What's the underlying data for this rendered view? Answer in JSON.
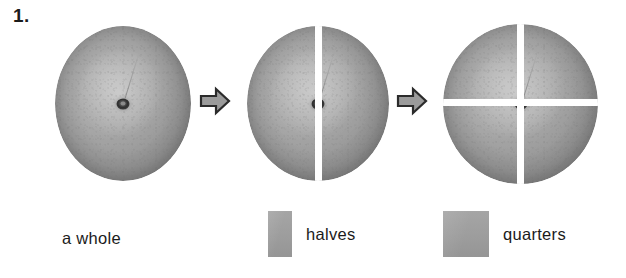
{
  "worksheet": {
    "question_number": "1.",
    "background_color": "#ffffff",
    "text_color": "#1b1b1b"
  },
  "diagram": {
    "type": "fraction-partition-sequence",
    "stages": [
      {
        "name": "whole",
        "label": "a whole",
        "pieces": 1,
        "cuts": [],
        "fruit_color": "#a9a9a9"
      },
      {
        "name": "halves",
        "label": "halves",
        "pieces": 2,
        "cuts": [
          "vertical"
        ],
        "fruit_color": "#a9a9a9"
      },
      {
        "name": "quarters",
        "label": "quarters",
        "pieces": 4,
        "cuts": [
          "vertical",
          "horizontal"
        ],
        "fruit_color": "#a9a9a9"
      }
    ],
    "arrows": [
      {
        "direction": "right",
        "from": "whole",
        "to": "halves"
      },
      {
        "direction": "right",
        "from": "halves",
        "to": "quarters"
      }
    ],
    "arrow_fill": "#9b9b9b",
    "arrow_stroke": "#2b2b2b",
    "cut_gap_color": "#ffffff"
  },
  "legend": {
    "swatch_color": "#9d9d9d",
    "entries": [
      {
        "label": "a whole",
        "has_swatch": false
      },
      {
        "label": "halves",
        "has_swatch": true
      },
      {
        "label": "quarters",
        "has_swatch": true
      }
    ]
  }
}
